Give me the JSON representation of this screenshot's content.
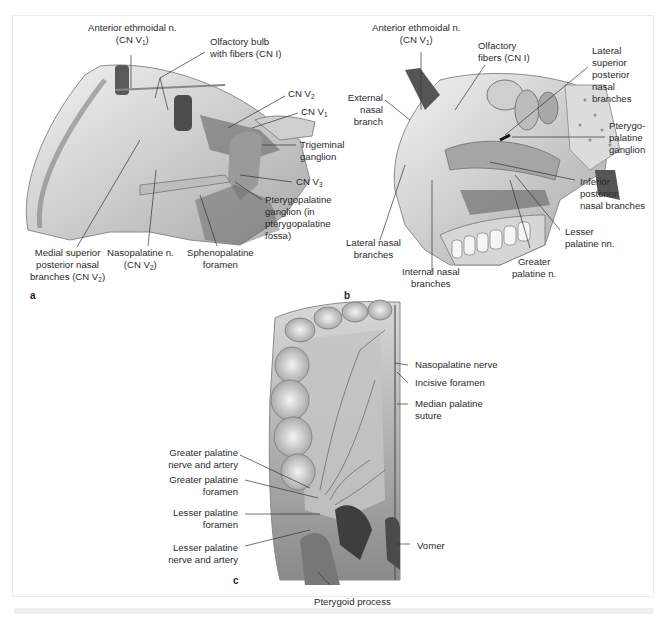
{
  "figure": {
    "panels": [
      {
        "letter": "a",
        "view": "medial nasal wall, sagittal",
        "labels": {
          "anterior_ethmoidal": [
            "Anterior ethmoidal n.",
            "(CN V1)"
          ],
          "olfactory_bulb": [
            "Olfactory bulb",
            "with fibers (CN I)"
          ],
          "cn_v2": "CN V2",
          "cn_v1": "CN V1",
          "trigeminal_ganglion": [
            "Trigeminal",
            "ganglion"
          ],
          "cn_v3": "CN V3",
          "pterygopalatine_ganglion": [
            "Pterygopalatine",
            "ganglion (in",
            "pterygopalatine",
            "fossa)"
          ],
          "sphenopalatine_foramen": [
            "Sphenopalatine",
            "foramen"
          ],
          "nasopalatine": [
            "Nasopalatine n.",
            "(CN V2)"
          ],
          "medial_superior_posterior": [
            "Medial superior",
            "posterior nasal",
            "branches (CN V2)"
          ]
        }
      },
      {
        "letter": "b",
        "view": "lateral nasal wall, sagittal",
        "labels": {
          "anterior_ethmoidal": [
            "Anterior ethmoidal  n.",
            "(CN V1)"
          ],
          "olfactory_fibers": [
            "Olfactory",
            "fibers (CN I)"
          ],
          "lateral_superior_posterior": [
            "Lateral",
            "superior",
            "posterior",
            "nasal",
            "branches"
          ],
          "external_nasal": [
            "External",
            "nasal",
            "branch"
          ],
          "pterygopalatine_ganglion": [
            "Pterygo-",
            "palatine",
            "ganglion"
          ],
          "inferior_posterior": [
            "Inferior",
            "posterior",
            "nasal branches"
          ],
          "lesser_palatine": [
            "Lesser",
            "palatine nn."
          ],
          "greater_palatine": [
            "Greater",
            "palatine n."
          ],
          "internal_nasal": [
            "Internal nasal",
            "branches"
          ],
          "lateral_nasal": [
            "Lateral nasal",
            "branches"
          ]
        }
      },
      {
        "letter": "c",
        "view": "hard palate, inferior",
        "labels": {
          "nasopalatine_nerve": "Nasopalatine nerve",
          "incisive_foramen": "Incisive foramen",
          "median_palatine_suture": [
            "Median palatine",
            "suture"
          ],
          "greater_palatine_na": [
            "Greater palatine",
            "nerve and artery"
          ],
          "greater_palatine_foramen": [
            "Greater palatine",
            "foramen"
          ],
          "lesser_palatine_foramen": [
            "Lesser palatine",
            "foramen"
          ],
          "lesser_palatine_na": [
            "Lesser palatine",
            "nerve and artery"
          ],
          "vomer": "Vomer",
          "pterygoid_process": "Pterygoid process"
        }
      }
    ],
    "colors": {
      "frame": "#ececec",
      "leader": "#333333",
      "tissue_light": "#e9e9e9",
      "tissue_mid": "#bdbdbd",
      "tissue_dark": "#6e6e6e"
    }
  }
}
